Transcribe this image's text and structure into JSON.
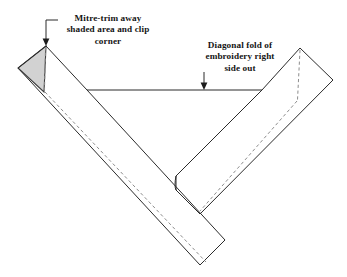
{
  "figure": {
    "background_color": "#ffffff",
    "stroke_color": "#2b2b2b",
    "dashed_color": "#8d8d8d",
    "shade_fill": "#d2d2d2",
    "shade_stroke": "#4a4a4a"
  },
  "annotations": [
    {
      "id": "mitre-trim",
      "text": "Mitre-trim away\nshaded area and clip\ncorner",
      "lines": [
        "Mitre-trim away",
        "shaded area and clip",
        "corner"
      ],
      "leader": "elbow-down-arrow",
      "points_to": "shaded-triangle-apex"
    },
    {
      "id": "diagonal-fold",
      "text": "Diagonal fold of\nembroidery right\nside out",
      "lines": [
        "Diagonal fold of",
        "embroidery right",
        "side out"
      ],
      "leader": "straight-down-arrow",
      "points_to": "horizontal-fold-line"
    }
  ],
  "shapes": {
    "left_strip": {
      "name": "left-diagonal-strip",
      "outline": "46,46 87,90 225,240 200,265 18,68"
    },
    "right_strip": {
      "name": "right-diagonal-strip",
      "outline": "300,48 333,80 200,214 176,190 176,174 262,90"
    },
    "shaded_triangle": {
      "name": "shaded-trim-triangle",
      "outline": "46,46 18,68 44,92",
      "fill": "#d2d2d2"
    },
    "fold_line": {
      "name": "horizontal-fold-line",
      "from_x": 87,
      "to_x": 262,
      "y": 90
    },
    "dashed_guides": [
      "46,47 45,90",
      "45,92 205,262",
      "300,50 298,100",
      "297,101 200,211"
    ]
  }
}
